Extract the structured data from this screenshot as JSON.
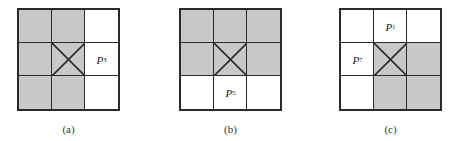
{
  "figure": {
    "panels": [
      {
        "caption": "(a)",
        "shaded": [
          [
            1,
            1,
            0
          ],
          [
            1,
            1,
            0
          ],
          [
            1,
            1,
            0
          ]
        ],
        "labels": [
          {
            "row": 1,
            "col": 2,
            "letter": "P",
            "sub": "3"
          }
        ]
      },
      {
        "caption": "(b)",
        "shaded": [
          [
            1,
            1,
            1
          ],
          [
            1,
            1,
            1
          ],
          [
            0,
            0,
            0
          ]
        ],
        "labels": [
          {
            "row": 2,
            "col": 1,
            "letter": "P",
            "sub": "5"
          }
        ]
      },
      {
        "caption": "(c)",
        "shaded": [
          [
            0,
            0,
            0
          ],
          [
            0,
            1,
            1
          ],
          [
            0,
            1,
            1
          ]
        ],
        "labels": [
          {
            "row": 0,
            "col": 1,
            "letter": "P",
            "sub": "1"
          },
          {
            "row": 1,
            "col": 0,
            "letter": "P",
            "sub": "7"
          }
        ]
      }
    ],
    "center_mark": "x-cross",
    "colors": {
      "shade": "#c8c8c8",
      "line": "#2a2a2a",
      "background": "#ffffff"
    }
  }
}
